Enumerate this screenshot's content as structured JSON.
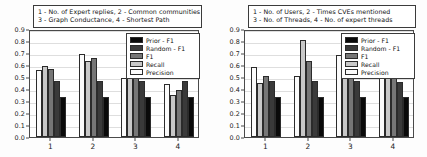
{
  "figure": {
    "background_color": "#fdfdfd",
    "axis_color": "#4a4a4a",
    "grid_color": "#dedede"
  },
  "series_styles": [
    {
      "name": "Prior - F1",
      "color": "#0a0a0a"
    },
    {
      "name": "Random - F1",
      "color": "#3a3a3a"
    },
    {
      "name": "F1",
      "color": "#767676"
    },
    {
      "name": "Recall",
      "color": "#c8c8c8"
    },
    {
      "name": "Precision",
      "color": "#fbfbfb"
    }
  ],
  "chart_data": [
    {
      "type": "bar",
      "panel": "left",
      "title": "",
      "title_lines": [
        "1 - No. of Expert replies, 2 - Common communities",
        "3 - Graph Conductance, 4 - Shortest Path"
      ],
      "xlabel": "",
      "ylabel": "",
      "categories": [
        "1",
        "2",
        "3",
        "4"
      ],
      "ylim": [
        0.0,
        0.9
      ],
      "yticks": [
        "0.0",
        "0.1",
        "0.2",
        "0.3",
        "0.4",
        "0.5",
        "0.6",
        "0.7",
        "0.8",
        "0.9"
      ],
      "grid": true,
      "legend_position": "upper right",
      "legend": [
        "Prior - F1",
        "Random - F1",
        "F1",
        "Recall",
        "Precision"
      ],
      "bar_order": [
        "Precision",
        "Recall",
        "F1",
        "Random - F1",
        "Prior - F1"
      ],
      "series": [
        {
          "name": "Precision",
          "color": "#fbfbfb",
          "values": [
            0.555,
            0.69,
            0.49,
            0.44
          ]
        },
        {
          "name": "Recall",
          "color": "#c8c8c8",
          "values": [
            0.59,
            0.63,
            0.67,
            0.35
          ]
        },
        {
          "name": "F1",
          "color": "#767676",
          "values": [
            0.57,
            0.66,
            0.57,
            0.39
          ]
        },
        {
          "name": "Random - F1",
          "color": "#3a3a3a",
          "values": [
            0.47,
            0.47,
            0.47,
            0.47
          ]
        },
        {
          "name": "Prior - F1",
          "color": "#0a0a0a",
          "values": [
            0.33,
            0.33,
            0.33,
            0.33
          ]
        }
      ]
    },
    {
      "type": "bar",
      "panel": "right",
      "title": "",
      "title_lines": [
        "1 - No. of Users, 2 - Times CVEs mentioned",
        "3 - No. of Threads, 4 - No. of expert threads"
      ],
      "xlabel": "",
      "ylabel": "",
      "categories": [
        "1",
        "2",
        "3",
        "4"
      ],
      "ylim": [
        0.0,
        0.9
      ],
      "yticks": [
        "0.0",
        "0.1",
        "0.2",
        "0.3",
        "0.4",
        "0.5",
        "0.6",
        "0.7",
        "0.8",
        "0.9"
      ],
      "grid": true,
      "legend_position": "upper right",
      "legend": [
        "Prior - F1",
        "Random - F1",
        "F1",
        "Recall",
        "Precision"
      ],
      "bar_order": [
        "Precision",
        "Recall",
        "F1",
        "Random - F1",
        "Prior - F1"
      ],
      "series": [
        {
          "name": "Precision",
          "color": "#fbfbfb",
          "values": [
            0.58,
            0.51,
            0.68,
            0.49
          ]
        },
        {
          "name": "Recall",
          "color": "#c8c8c8",
          "values": [
            0.45,
            0.81,
            0.585,
            0.51
          ]
        },
        {
          "name": "F1",
          "color": "#767676",
          "values": [
            0.51,
            0.63,
            0.63,
            0.51
          ]
        },
        {
          "name": "Random - F1",
          "color": "#3a3a3a",
          "values": [
            0.47,
            0.47,
            0.47,
            0.46
          ]
        },
        {
          "name": "Prior - F1",
          "color": "#0a0a0a",
          "values": [
            0.33,
            0.33,
            0.33,
            0.33
          ]
        }
      ]
    }
  ]
}
